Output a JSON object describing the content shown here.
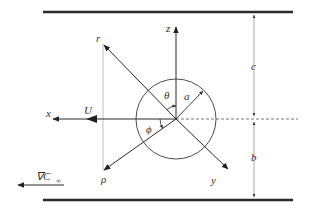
{
  "diagram": {
    "labels": {
      "z_axis": "z",
      "x_axis": "x",
      "y_axis": "y",
      "r_axis": "r",
      "rho_axis": "ρ",
      "theta": "θ",
      "phi": "ϕ",
      "radius": "a",
      "velocity": "U",
      "gap_top": "c",
      "gap_bottom": "b",
      "gradient_symbol": "∇C",
      "gradient_subscript": "∞"
    },
    "colors": {
      "wall": "#2a2a2a",
      "line": "#3a3a3a",
      "thin_line": "#888888",
      "text": "#333333"
    }
  }
}
